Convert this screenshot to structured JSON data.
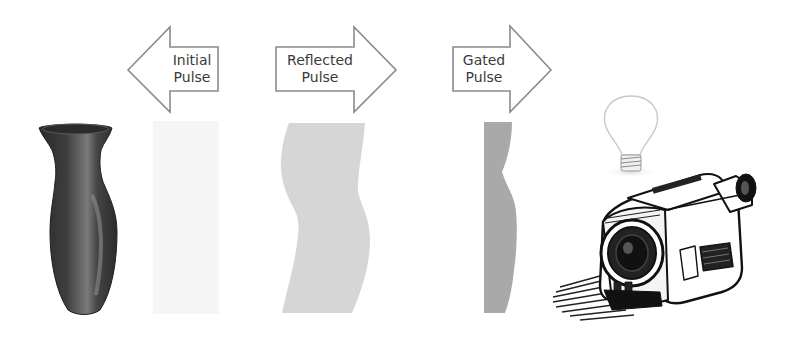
{
  "diagram": {
    "arrows": [
      {
        "id": "initial",
        "line1": "Initial",
        "line2": "Pulse",
        "direction": "left"
      },
      {
        "id": "reflected",
        "line1": "Reflected",
        "line2": "Pulse",
        "direction": "right"
      },
      {
        "id": "gated",
        "line1": "Gated",
        "line2": "Pulse",
        "direction": "right"
      }
    ],
    "objects": [
      {
        "id": "vase",
        "icon": "vase-icon"
      },
      {
        "id": "initial-pulse",
        "icon": "initial-pulse-shape",
        "fill": "#f5f5f5"
      },
      {
        "id": "reflected-pulse",
        "icon": "reflected-pulse-shape",
        "fill": "#d6d6d6"
      },
      {
        "id": "gated-pulse",
        "icon": "gated-pulse-shape",
        "fill": "#a9a9a9"
      },
      {
        "id": "light-bulb",
        "icon": "light-bulb-icon"
      },
      {
        "id": "camcorder",
        "icon": "camcorder-icon"
      }
    ],
    "colors": {
      "arrow_stroke": "#8a8a8a",
      "text": "#3a3a3a",
      "vase": "#3c3c3c"
    }
  }
}
